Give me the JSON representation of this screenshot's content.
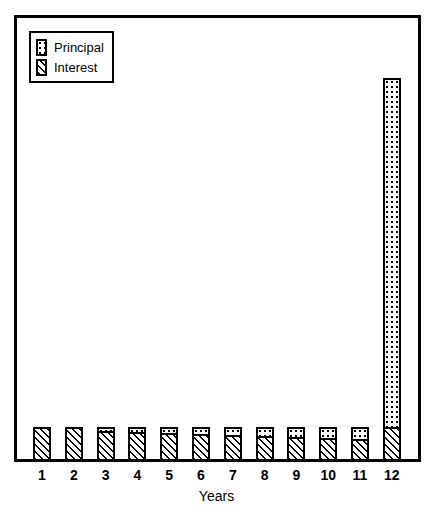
{
  "chart_data": {
    "type": "bar",
    "stacked": true,
    "title": "",
    "subtitle": "",
    "xlabel": "Years",
    "ylabel": "",
    "grid": false,
    "legend_position": "top-left",
    "categories": [
      "1",
      "2",
      "3",
      "4",
      "5",
      "6",
      "7",
      "8",
      "9",
      "10",
      "11",
      "12"
    ],
    "ylim": [
      0,
      430
    ],
    "series": [
      {
        "name": "Interest",
        "pattern": "diagonal-hatch",
        "values": [
          34,
          34,
          30,
          29,
          28,
          27,
          26,
          25,
          24,
          23,
          22,
          34
        ]
      },
      {
        "name": "Principal",
        "pattern": "dots",
        "values": [
          1,
          1,
          5,
          6,
          7,
          8,
          9,
          10,
          11,
          12,
          13,
          350
        ]
      }
    ],
    "totals": [
      35,
      35,
      35,
      35,
      35,
      35,
      35,
      35,
      35,
      35,
      35,
      384
    ],
    "annotations": []
  },
  "legend": {
    "items": [
      {
        "label": "Principal",
        "pattern": "dots"
      },
      {
        "label": "Interest",
        "pattern": "diagonal-hatch"
      }
    ]
  },
  "axis": {
    "x_title": "Years",
    "x_tick_labels": [
      "1",
      "2",
      "3",
      "4",
      "5",
      "6",
      "7",
      "8",
      "9",
      "10",
      "11",
      "12"
    ]
  },
  "colors": {
    "foreground": "#000000",
    "background": "#ffffff",
    "frame": "#000000"
  }
}
